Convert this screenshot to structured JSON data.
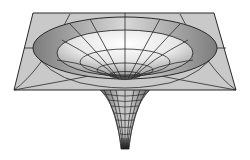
{
  "figure": {
    "title": "Curved spacetime gravity well",
    "colors": {
      "background": "#ffffff",
      "plane": "#c8c8c8",
      "outer_ring": "#8a8a8a",
      "inner_bowl_light": "#f4f4f4",
      "inner_bowl_mid": "#b5b5b5",
      "throat": "#9a9a9a",
      "tip": "#1a1a1a",
      "grid_line": "#2a2a2a"
    },
    "plane": {
      "corners": [
        [
          33,
          13
        ],
        [
          214,
          13
        ],
        [
          236,
          90
        ],
        [
          14,
          90
        ]
      ]
    },
    "center": [
      125,
      80
    ],
    "rings": [
      {
        "cy": 48,
        "rx": 92,
        "ry": 31
      },
      {
        "cy": 53,
        "rx": 68,
        "ry": 21
      },
      {
        "cy": 63,
        "rx": 43,
        "ry": 11
      },
      {
        "cy": 70,
        "rx": 27,
        "ry": 6
      },
      {
        "cy": 75,
        "rx": 14,
        "ry": 3
      }
    ],
    "tip": [
      125,
      149
    ]
  }
}
